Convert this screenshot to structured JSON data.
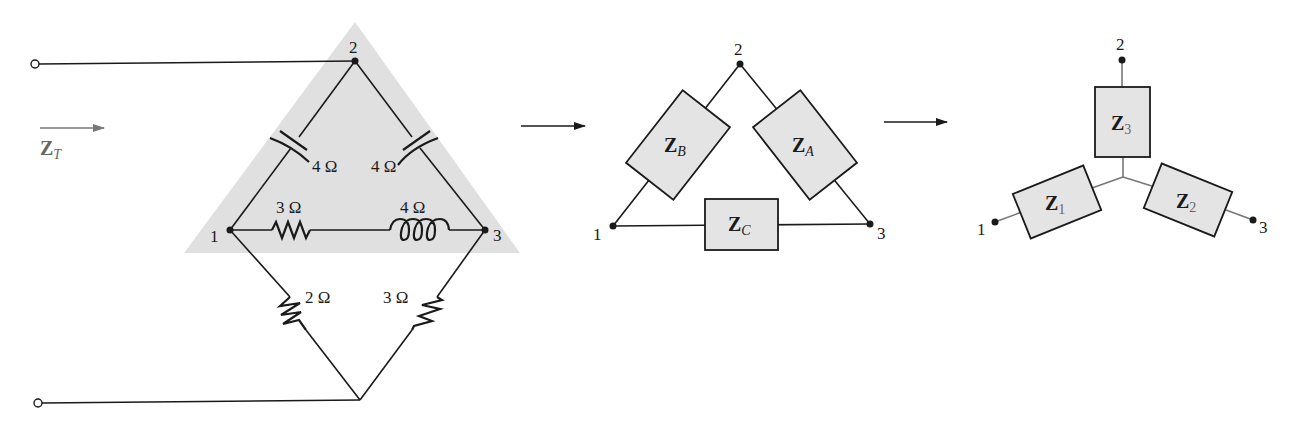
{
  "figure": {
    "panels": [
      {
        "id": "original-network",
        "input_label": {
          "main": "Z",
          "sub": "T"
        },
        "nodes": [
          {
            "id": "1",
            "label": "1"
          },
          {
            "id": "2",
            "label": "2"
          },
          {
            "id": "3",
            "label": "3"
          }
        ],
        "components": {
          "cap_left": {
            "type": "capacitor",
            "branch": "1-2",
            "value": "4 Ω"
          },
          "cap_right": {
            "type": "capacitor",
            "branch": "2-3",
            "value": "4 Ω"
          },
          "res_top": {
            "type": "resistor",
            "branch": "1-3",
            "value": "3 Ω"
          },
          "ind_top": {
            "type": "inductor",
            "branch": "1-3",
            "value": "4 Ω"
          },
          "res_bottom_left": {
            "type": "resistor",
            "branch": "1-bottom",
            "value": "2 Ω"
          },
          "res_bottom_right": {
            "type": "resistor",
            "branch": "3-bottom",
            "value": "3 Ω"
          }
        },
        "highlight_color": "#e0e0e0"
      },
      {
        "id": "delta-equivalent",
        "nodes": [
          {
            "id": "1",
            "label": "1"
          },
          {
            "id": "2",
            "label": "2"
          },
          {
            "id": "3",
            "label": "3"
          }
        ],
        "impedances": {
          "A": {
            "main": "Z",
            "sub": "A"
          },
          "B": {
            "main": "Z",
            "sub": "B"
          },
          "C": {
            "main": "Z",
            "sub": "C"
          }
        }
      },
      {
        "id": "wye-equivalent",
        "nodes": [
          {
            "id": "1",
            "label": "1"
          },
          {
            "id": "2",
            "label": "2"
          },
          {
            "id": "3",
            "label": "3"
          }
        ],
        "impedances": {
          "1": {
            "main": "Z",
            "sub": "1"
          },
          "2": {
            "main": "Z",
            "sub": "2"
          },
          "3": {
            "main": "Z",
            "sub": "3"
          }
        }
      }
    ],
    "colors": {
      "box_fill": "#e4e4e4",
      "highlight": "#e0e0e0",
      "line": "#1a1a1a"
    }
  }
}
